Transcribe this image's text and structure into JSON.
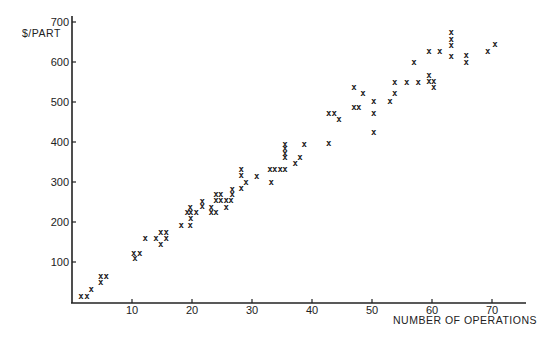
{
  "chart_data": {
    "type": "scatter",
    "title": "",
    "xlabel": "NUMBER OF OPERATIONS",
    "ylabel": "$/PART",
    "xlim": [
      0,
      75
    ],
    "ylim": [
      0,
      700
    ],
    "x_ticks": [
      10,
      20,
      30,
      40,
      50,
      60,
      70
    ],
    "y_ticks": [
      100,
      200,
      300,
      400,
      500,
      600,
      700
    ],
    "grid": false,
    "legend": null,
    "marker": "x",
    "points": [
      [
        1.5,
        15
      ],
      [
        2.5,
        15
      ],
      [
        3.2,
        32
      ],
      [
        4.8,
        65
      ],
      [
        5.7,
        65
      ],
      [
        4.8,
        50
      ],
      [
        10.3,
        122
      ],
      [
        11.3,
        122
      ],
      [
        10.5,
        110
      ],
      [
        12.2,
        160
      ],
      [
        14,
        160
      ],
      [
        14.8,
        175
      ],
      [
        15.7,
        175
      ],
      [
        15.7,
        160
      ],
      [
        14.8,
        145
      ],
      [
        18.2,
        192
      ],
      [
        19.7,
        192
      ],
      [
        19.7,
        238
      ],
      [
        19.2,
        225
      ],
      [
        19.8,
        225
      ],
      [
        20.7,
        225
      ],
      [
        19.8,
        210
      ],
      [
        21.7,
        252
      ],
      [
        21.7,
        240
      ],
      [
        23.2,
        238
      ],
      [
        23.2,
        225
      ],
      [
        24,
        225
      ],
      [
        24,
        270
      ],
      [
        24.8,
        270
      ],
      [
        24,
        255
      ],
      [
        24.8,
        255
      ],
      [
        25.7,
        255
      ],
      [
        26.5,
        255
      ],
      [
        25.7,
        238
      ],
      [
        26.7,
        282
      ],
      [
        26.7,
        270
      ],
      [
        28.2,
        332
      ],
      [
        28.2,
        318
      ],
      [
        29,
        300
      ],
      [
        28.2,
        285
      ],
      [
        30.8,
        315
      ],
      [
        33,
        332
      ],
      [
        33.8,
        332
      ],
      [
        34.7,
        332
      ],
      [
        35.5,
        332
      ],
      [
        33.2,
        300
      ],
      [
        35.5,
        395
      ],
      [
        35.5,
        385
      ],
      [
        35.5,
        372
      ],
      [
        35.5,
        362
      ],
      [
        38.7,
        395
      ],
      [
        38,
        362
      ],
      [
        37.2,
        348
      ],
      [
        42.8,
        398
      ],
      [
        42.8,
        472
      ],
      [
        43.7,
        472
      ],
      [
        44.5,
        458
      ],
      [
        47,
        538
      ],
      [
        48.5,
        522
      ],
      [
        47,
        488
      ],
      [
        47.8,
        488
      ],
      [
        50.3,
        502
      ],
      [
        50.3,
        472
      ],
      [
        50.3,
        425
      ],
      [
        53,
        502
      ],
      [
        53.8,
        550
      ],
      [
        53.8,
        522
      ],
      [
        55.8,
        550
      ],
      [
        57.7,
        550
      ],
      [
        57,
        600
      ],
      [
        59.5,
        628
      ],
      [
        61.3,
        628
      ],
      [
        59.5,
        568
      ],
      [
        59.5,
        552
      ],
      [
        60.3,
        552
      ],
      [
        60.3,
        538
      ],
      [
        63.2,
        675
      ],
      [
        63.2,
        658
      ],
      [
        63.2,
        642
      ],
      [
        63.2,
        615
      ],
      [
        65.7,
        618
      ],
      [
        65.7,
        600
      ],
      [
        69.3,
        628
      ],
      [
        70.5,
        645
      ]
    ]
  }
}
